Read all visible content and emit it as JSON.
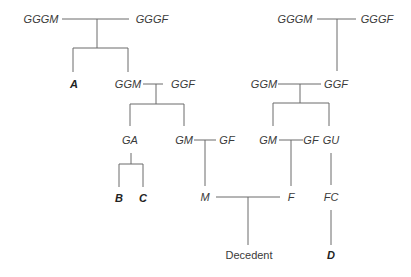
{
  "diagram": {
    "type": "family-tree",
    "colors": {
      "line": "#6a6a6a",
      "text": "#3a3a3a",
      "background": "#ffffff"
    },
    "nodes": {
      "left_gggm": "GGGM",
      "left_gggf": "GGGF",
      "a": "A",
      "left_ggm": "GGM",
      "left_ggf": "GGF",
      "ga": "GA",
      "left_gm": "GM",
      "left_gf": "GF",
      "b": "B",
      "c": "C",
      "m": "M",
      "right_gggm": "GGGM",
      "right_gggf": "GGGF",
      "right_ggm": "GGM",
      "right_ggf": "GGF",
      "right_gm": "GM",
      "right_gf": "GF",
      "gu": "GU",
      "f": "F",
      "fc": "FC",
      "decedent": "Decedent",
      "d": "D"
    }
  }
}
